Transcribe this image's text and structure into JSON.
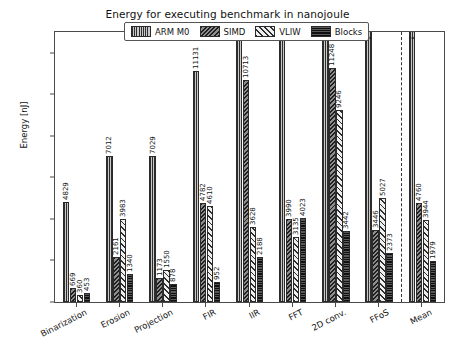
{
  "chart_data": {
    "type": "bar",
    "title": "Energy for executing benchmark in nanojoule",
    "xlabel": "",
    "ylabel": "Energy [nJ]",
    "ylim": [
      0,
      13000
    ],
    "yticks": [
      0,
      2000,
      4000,
      6000,
      8000,
      10000,
      12000
    ],
    "grid": false,
    "legend_position": "upper center",
    "categories": [
      "Binarization",
      "Erosion",
      "Projection",
      "FIR",
      "IIR",
      "FFT",
      "2D conv.",
      "FFoS",
      "Mean"
    ],
    "series": [
      {
        "name": "ARM M0",
        "color": "#9a9a9a",
        "hatch": "vertical-stripes",
        "values": [
          4829,
          7012,
          7029,
          11131,
          19787,
          51078,
          18434,
          14323,
          16703
        ],
        "labels": [
          "4829",
          "7012",
          "7029",
          "11131",
          "",
          "",
          "",
          "",
          ""
        ],
        "overflow_labels": [
          "",
          "",
          "",
          "",
          "↓ 19787",
          "↓ 51078",
          "↓ 18434",
          "↓ 14323",
          "↓ 16703"
        ]
      },
      {
        "name": "SIMD",
        "color": "#6e6e6e",
        "hatch": "dense-diagonal",
        "values": [
          669,
          2161,
          1173,
          4782,
          10713,
          3990,
          11248,
          3446,
          4760
        ],
        "labels": [
          "669",
          "2161",
          "1173",
          "4782",
          "10713",
          "3990",
          "11248",
          "3446",
          "4760"
        ],
        "overflow_labels": [
          "",
          "",
          "",
          "",
          "",
          "",
          "",
          "",
          ""
        ]
      },
      {
        "name": "VLIW",
        "color": "#e6e6e6",
        "hatch": "diagonal-hatch",
        "values": [
          360,
          3983,
          1550,
          4610,
          3628,
          3135,
          9246,
          5027,
          3944
        ],
        "labels": [
          "360",
          "3983",
          "1550",
          "4610",
          "3628",
          "3135",
          "9246",
          "5027",
          "3944"
        ],
        "overflow_labels": [
          "",
          "",
          "",
          "",
          "",
          "",
          "",
          "",
          ""
        ]
      },
      {
        "name": "Blocks",
        "color": "#3a3a3a",
        "hatch": "checker-dense",
        "values": [
          453,
          1340,
          878,
          952,
          2188,
          4023,
          3442,
          2373,
          1979
        ],
        "labels": [
          "453",
          "1340",
          "878",
          "952",
          "2188",
          "4023",
          "3442",
          "2373",
          "1979"
        ],
        "overflow_labels": [
          "",
          "",
          "",
          "",
          "",
          "",
          "",
          "",
          ""
        ]
      }
    ],
    "mean_divider_after_category": "FFoS"
  }
}
